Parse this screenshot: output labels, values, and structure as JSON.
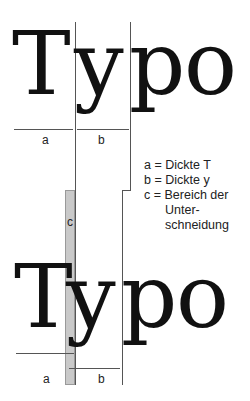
{
  "top_word": {
    "T": "T",
    "y": "y",
    "p": "p",
    "o": "o"
  },
  "bottom_word": {
    "T": "T",
    "y": "y",
    "p": "p",
    "o": "o"
  },
  "labels": {
    "a": "a",
    "b": "b",
    "c": "c"
  },
  "legend": [
    {
      "key": "a =",
      "text": "Dickte T"
    },
    {
      "key": "b =",
      "text": "Dickte y"
    },
    {
      "key": "c =",
      "text": "Bereich der"
    },
    {
      "key": "",
      "text": "Unter-"
    },
    {
      "key": "",
      "text": "schneidung"
    }
  ],
  "colors": {
    "ink": "#111111",
    "rule": "#555555",
    "kern_fill": "#c9c9c9"
  }
}
